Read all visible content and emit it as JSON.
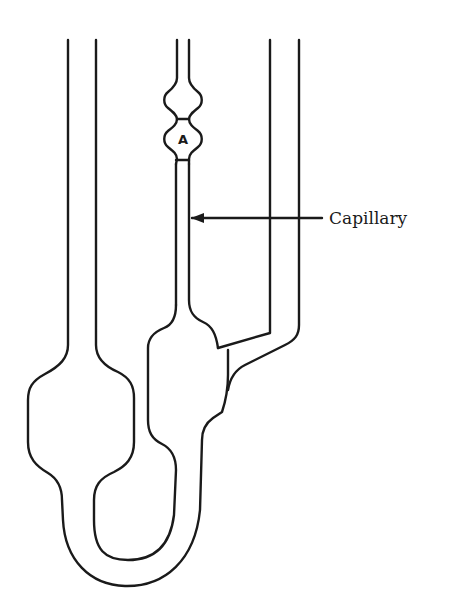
{
  "diagram": {
    "type": "viscometer-schematic",
    "labels": {
      "capillary": "Capillary",
      "bulb_a": "A"
    },
    "annotations": [
      {
        "text": "Capillary",
        "points_to": "capillary-tube",
        "arrow_direction": "left"
      },
      {
        "text": "A",
        "target": "measuring-bulb-a"
      }
    ],
    "components": [
      "left-filling-tube",
      "reservoir-bulb",
      "u-bend",
      "lower-bulb",
      "capillary-tube",
      "measuring-bulb-a",
      "upper-bulb",
      "right-vent-tube"
    ],
    "colors": {
      "stroke": "#1a1a1a",
      "background": "#ffffff"
    }
  }
}
